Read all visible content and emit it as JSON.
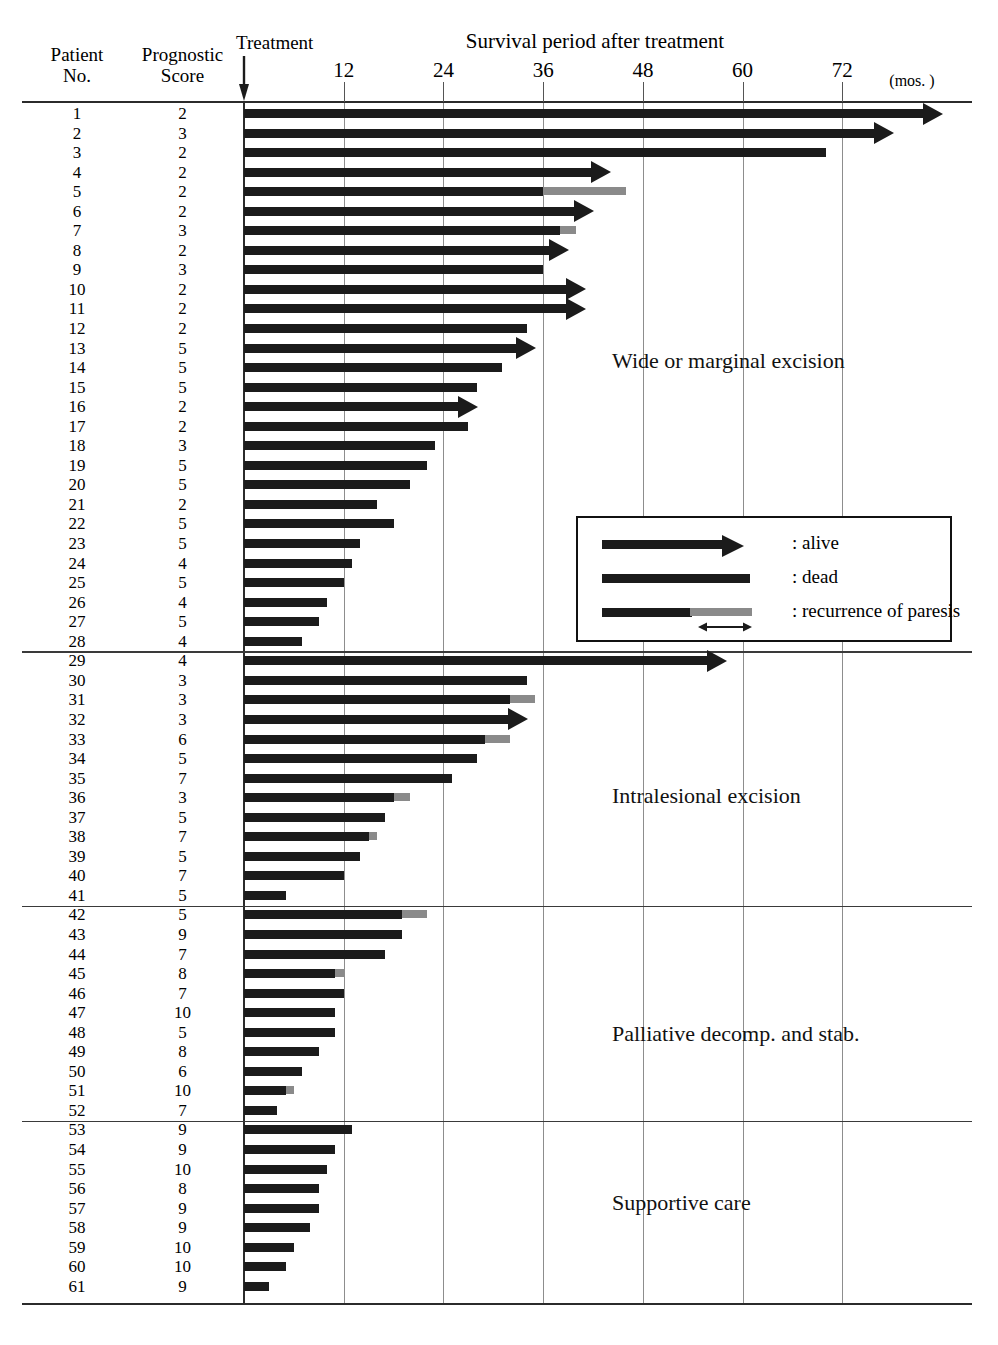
{
  "header": {
    "patient_col": "Patient\nNo.",
    "patient_col_line1": "Patient",
    "patient_col_line2": "No.",
    "score_col_line1": "Prognostic",
    "score_col_line2": "Score",
    "treatment_label": "Treatment",
    "axis_title": "Survival period after treatment",
    "axis_unit": "(mos. )"
  },
  "axis": {
    "ticks": [
      12,
      24,
      36,
      48,
      60,
      72
    ],
    "tick_labels": [
      "12",
      "24",
      "36",
      "48",
      "60",
      "72"
    ],
    "min": 0,
    "max": 84,
    "px_per_month": 8.31,
    "origin_px": 244
  },
  "legend": {
    "items": [
      {
        "symbol": "arrow-bar",
        "label": ": alive"
      },
      {
        "symbol": "bar",
        "label": ": dead"
      },
      {
        "symbol": "bar-gray",
        "label": ": recurrence of paresis"
      }
    ]
  },
  "groups": [
    {
      "name": "Wide or marginal excision",
      "first": 1,
      "last": 28,
      "label_top": 348
    },
    {
      "name": "Intralesional excision",
      "first": 29,
      "last": 41,
      "label_top": 783
    },
    {
      "name": "Palliative decomp. and stab.",
      "first": 42,
      "last": 52,
      "label_top": 1021
    },
    {
      "name": "Supportive care",
      "first": 53,
      "last": 61,
      "label_top": 1190
    }
  ],
  "colors": {
    "bar": "#1b1b1b",
    "recurrence": "#8a8a8a",
    "grid": "#8d8d8d",
    "axis": "#2b2b2b",
    "background": "#ffffff"
  },
  "chart_data": {
    "type": "bar",
    "title": "Survival period after treatment",
    "xlabel": "(mos. )",
    "ylabel": "Patient No.",
    "xlim": [
      0,
      84
    ],
    "grid": true,
    "legend_position": "right-middle",
    "categories": [
      "1",
      "2",
      "3",
      "4",
      "5",
      "6",
      "7",
      "8",
      "9",
      "10",
      "11",
      "12",
      "13",
      "14",
      "15",
      "16",
      "17",
      "18",
      "19",
      "20",
      "21",
      "22",
      "23",
      "24",
      "25",
      "26",
      "27",
      "28",
      "29",
      "30",
      "31",
      "32",
      "33",
      "34",
      "35",
      "36",
      "37",
      "38",
      "39",
      "40",
      "41",
      "42",
      "43",
      "44",
      "45",
      "46",
      "47",
      "48",
      "49",
      "50",
      "51",
      "52",
      "53",
      "54",
      "55",
      "56",
      "57",
      "58",
      "59",
      "60",
      "61"
    ],
    "series": [
      {
        "name": "Survival period (months)",
        "values": [
          82,
          76,
          70,
          42,
          46,
          40,
          40,
          37,
          36,
          39,
          39,
          34,
          33,
          31,
          28,
          26,
          27,
          23,
          22,
          20,
          16,
          18,
          14,
          13,
          12,
          10,
          9,
          7,
          56,
          34,
          35,
          32,
          32,
          28,
          25,
          20,
          17,
          16,
          14,
          12,
          5,
          22,
          19,
          17,
          12,
          12,
          11,
          11,
          9,
          7,
          6,
          4,
          13,
          11,
          10,
          9,
          9,
          8,
          6,
          5,
          3
        ]
      },
      {
        "name": "Recurrence of paresis onset (months)",
        "values": [
          null,
          null,
          null,
          null,
          36,
          null,
          38,
          null,
          null,
          null,
          null,
          null,
          null,
          null,
          null,
          null,
          null,
          null,
          null,
          null,
          null,
          null,
          null,
          null,
          null,
          null,
          null,
          null,
          null,
          null,
          32,
          null,
          29,
          null,
          null,
          18,
          null,
          15,
          null,
          null,
          null,
          19,
          null,
          null,
          11,
          null,
          null,
          null,
          null,
          null,
          6,
          null,
          null,
          null,
          null,
          null,
          null,
          null,
          null,
          null,
          null
        ]
      }
    ],
    "rows": [
      {
        "no": "1",
        "score": "2",
        "end": 82,
        "status": "alive",
        "recurrence_start": null
      },
      {
        "no": "2",
        "score": "3",
        "end": 76,
        "status": "alive",
        "recurrence_start": null
      },
      {
        "no": "3",
        "score": "2",
        "end": 70,
        "status": "dead",
        "recurrence_start": null
      },
      {
        "no": "4",
        "score": "2",
        "end": 42,
        "status": "alive",
        "recurrence_start": null
      },
      {
        "no": "5",
        "score": "2",
        "end": 46,
        "status": "dead",
        "recurrence_start": 36
      },
      {
        "no": "6",
        "score": "2",
        "end": 40,
        "status": "alive",
        "recurrence_start": null
      },
      {
        "no": "7",
        "score": "3",
        "end": 40,
        "status": "dead",
        "recurrence_start": 38
      },
      {
        "no": "8",
        "score": "2",
        "end": 37,
        "status": "alive",
        "recurrence_start": null
      },
      {
        "no": "9",
        "score": "3",
        "end": 36,
        "status": "dead",
        "recurrence_start": null
      },
      {
        "no": "10",
        "score": "2",
        "end": 39,
        "status": "alive",
        "recurrence_start": null
      },
      {
        "no": "11",
        "score": "2",
        "end": 39,
        "status": "alive",
        "recurrence_start": null
      },
      {
        "no": "12",
        "score": "2",
        "end": 34,
        "status": "dead",
        "recurrence_start": null
      },
      {
        "no": "13",
        "score": "5",
        "end": 33,
        "status": "alive",
        "recurrence_start": null
      },
      {
        "no": "14",
        "score": "5",
        "end": 31,
        "status": "dead",
        "recurrence_start": null
      },
      {
        "no": "15",
        "score": "5",
        "end": 28,
        "status": "dead",
        "recurrence_start": null
      },
      {
        "no": "16",
        "score": "2",
        "end": 26,
        "status": "alive",
        "recurrence_start": null
      },
      {
        "no": "17",
        "score": "2",
        "end": 27,
        "status": "dead",
        "recurrence_start": null
      },
      {
        "no": "18",
        "score": "3",
        "end": 23,
        "status": "dead",
        "recurrence_start": null
      },
      {
        "no": "19",
        "score": "5",
        "end": 22,
        "status": "dead",
        "recurrence_start": null
      },
      {
        "no": "20",
        "score": "5",
        "end": 20,
        "status": "dead",
        "recurrence_start": null
      },
      {
        "no": "21",
        "score": "2",
        "end": 16,
        "status": "dead",
        "recurrence_start": null
      },
      {
        "no": "22",
        "score": "5",
        "end": 18,
        "status": "dead",
        "recurrence_start": null
      },
      {
        "no": "23",
        "score": "5",
        "end": 14,
        "status": "dead",
        "recurrence_start": null
      },
      {
        "no": "24",
        "score": "4",
        "end": 13,
        "status": "dead",
        "recurrence_start": null
      },
      {
        "no": "25",
        "score": "5",
        "end": 12,
        "status": "dead",
        "recurrence_start": null
      },
      {
        "no": "26",
        "score": "4",
        "end": 10,
        "status": "dead",
        "recurrence_start": null
      },
      {
        "no": "27",
        "score": "5",
        "end": 9,
        "status": "dead",
        "recurrence_start": null
      },
      {
        "no": "28",
        "score": "4",
        "end": 7,
        "status": "dead",
        "recurrence_start": null
      },
      {
        "no": "29",
        "score": "4",
        "end": 56,
        "status": "alive",
        "recurrence_start": null
      },
      {
        "no": "30",
        "score": "3",
        "end": 34,
        "status": "dead",
        "recurrence_start": null
      },
      {
        "no": "31",
        "score": "3",
        "end": 35,
        "status": "dead",
        "recurrence_start": 32
      },
      {
        "no": "32",
        "score": "3",
        "end": 32,
        "status": "alive",
        "recurrence_start": null
      },
      {
        "no": "33",
        "score": "6",
        "end": 32,
        "status": "dead",
        "recurrence_start": 29
      },
      {
        "no": "34",
        "score": "5",
        "end": 28,
        "status": "dead",
        "recurrence_start": null
      },
      {
        "no": "35",
        "score": "7",
        "end": 25,
        "status": "dead",
        "recurrence_start": null
      },
      {
        "no": "36",
        "score": "3",
        "end": 20,
        "status": "dead",
        "recurrence_start": 18
      },
      {
        "no": "37",
        "score": "5",
        "end": 17,
        "status": "dead",
        "recurrence_start": null
      },
      {
        "no": "38",
        "score": "7",
        "end": 16,
        "status": "dead",
        "recurrence_start": 15
      },
      {
        "no": "39",
        "score": "5",
        "end": 14,
        "status": "dead",
        "recurrence_start": null
      },
      {
        "no": "40",
        "score": "7",
        "end": 12,
        "status": "dead",
        "recurrence_start": null
      },
      {
        "no": "41",
        "score": "5",
        "end": 5,
        "status": "dead",
        "recurrence_start": null
      },
      {
        "no": "42",
        "score": "5",
        "end": 22,
        "status": "dead",
        "recurrence_start": 19
      },
      {
        "no": "43",
        "score": "9",
        "end": 19,
        "status": "dead",
        "recurrence_start": null
      },
      {
        "no": "44",
        "score": "7",
        "end": 17,
        "status": "dead",
        "recurrence_start": null
      },
      {
        "no": "45",
        "score": "8",
        "end": 12,
        "status": "dead",
        "recurrence_start": 11
      },
      {
        "no": "46",
        "score": "7",
        "end": 12,
        "status": "dead",
        "recurrence_start": null
      },
      {
        "no": "47",
        "score": "10",
        "end": 11,
        "status": "dead",
        "recurrence_start": null
      },
      {
        "no": "48",
        "score": "5",
        "end": 11,
        "status": "dead",
        "recurrence_start": null
      },
      {
        "no": "49",
        "score": "8",
        "end": 9,
        "status": "dead",
        "recurrence_start": null
      },
      {
        "no": "50",
        "score": "6",
        "end": 7,
        "status": "dead",
        "recurrence_start": null
      },
      {
        "no": "51",
        "score": "10",
        "end": 6,
        "status": "dead",
        "recurrence_start": 5
      },
      {
        "no": "52",
        "score": "7",
        "end": 4,
        "status": "dead",
        "recurrence_start": null
      },
      {
        "no": "53",
        "score": "9",
        "end": 13,
        "status": "dead",
        "recurrence_start": null
      },
      {
        "no": "54",
        "score": "9",
        "end": 11,
        "status": "dead",
        "recurrence_start": null
      },
      {
        "no": "55",
        "score": "10",
        "end": 10,
        "status": "dead",
        "recurrence_start": null
      },
      {
        "no": "56",
        "score": "8",
        "end": 9,
        "status": "dead",
        "recurrence_start": null
      },
      {
        "no": "57",
        "score": "9",
        "end": 9,
        "status": "dead",
        "recurrence_start": null
      },
      {
        "no": "58",
        "score": "9",
        "end": 8,
        "status": "dead",
        "recurrence_start": null
      },
      {
        "no": "59",
        "score": "10",
        "end": 6,
        "status": "dead",
        "recurrence_start": null
      },
      {
        "no": "60",
        "score": "10",
        "end": 5,
        "status": "dead",
        "recurrence_start": null
      },
      {
        "no": "61",
        "score": "9",
        "end": 3,
        "status": "dead",
        "recurrence_start": null
      }
    ]
  }
}
